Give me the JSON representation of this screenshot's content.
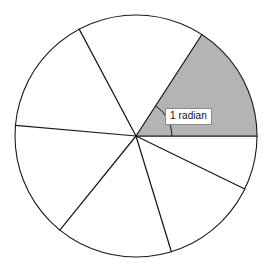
{
  "figure": {
    "name": "radian-sector-diagram",
    "background_color": "#ffffff",
    "stroke_color": "#1a1a1a",
    "shaded_color": "#b4b4b4",
    "label_border_color": "#8c8c8c",
    "label_text_color": "#101010"
  },
  "annotations": {
    "angle_label": "1 radian"
  },
  "chart_data": {
    "type": "pie",
    "title": "",
    "subtitle": "",
    "xlabel": "",
    "ylabel": "",
    "legend": [],
    "grid": false,
    "center": {
      "x": 136,
      "y": 136
    },
    "radius": 121,
    "arc_indicator_radius": 36,
    "angle_units": "radians",
    "categories": [
      "sector-1-radian",
      "sector-2",
      "sector-3",
      "sector-4",
      "sector-5",
      "sector-6",
      "sector-7"
    ],
    "radii_angles_deg": [
      0,
      57,
      118,
      175,
      231,
      287,
      334
    ],
    "radii_angles_rad": [
      0.0,
      1.0,
      2.06,
      3.05,
      4.03,
      5.01,
      5.83
    ],
    "values": [
      1.0,
      1.06,
      0.99,
      0.98,
      0.98,
      0.82,
      0.45
    ],
    "shaded_index": 0,
    "shaded_span_deg": [
      0,
      57
    ],
    "shaded_span_rad": [
      0.0,
      1.0
    ],
    "labels": [
      "1 radian",
      "",
      "",
      "",
      "",
      "",
      ""
    ],
    "colors": [
      "#b4b4b4",
      "#ffffff",
      "#ffffff",
      "#ffffff",
      "#ffffff",
      "#ffffff",
      "#ffffff"
    ]
  }
}
